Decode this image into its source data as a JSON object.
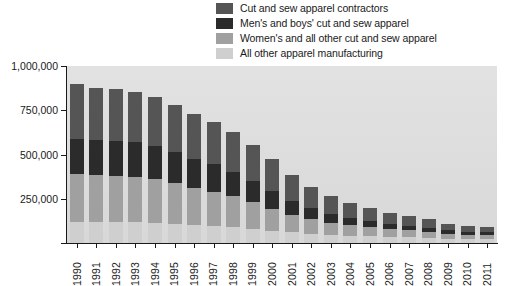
{
  "chart_data": {
    "type": "bar",
    "subtype": "stacked-vertical",
    "title": "",
    "xlabel": "",
    "ylabel": "",
    "ylim": [
      0,
      1000000
    ],
    "ytick_values": [
      0,
      250000,
      500000,
      750000,
      1000000
    ],
    "ytick_labels": [
      "",
      "250,000",
      "500,000",
      "750,000",
      "1,000,000"
    ],
    "grid": false,
    "legend_position": "top-center",
    "categories": [
      "1990",
      "1991",
      "1992",
      "1993",
      "1994",
      "1995",
      "1996",
      "1997",
      "1998",
      "1999",
      "2000",
      "2001",
      "2002",
      "2003",
      "2004",
      "2005",
      "2006",
      "2007",
      "2008",
      "2009",
      "2010",
      "2011"
    ],
    "stack_order_bottom_to_top": [
      "All other apparel manufacturing",
      "Women's and all other cut and sew apparel",
      "Men's and boys' cut and sew apparel",
      "Cut and sew apparel contractors"
    ],
    "series": [
      {
        "name": "Cut and sew apparel contractors",
        "color": "#555555",
        "values": [
          310000,
          295000,
          290000,
          285000,
          275000,
          265000,
          250000,
          240000,
          225000,
          205000,
          180000,
          145000,
          120000,
          100000,
          85000,
          72000,
          62000,
          55000,
          48000,
          38000,
          34000,
          32000
        ]
      },
      {
        "name": "Men's and boys' cut and sew apparel",
        "color": "#2b2b2b",
        "values": [
          200000,
          200000,
          198000,
          195000,
          190000,
          178000,
          165000,
          155000,
          140000,
          120000,
          100000,
          78000,
          62000,
          50000,
          42000,
          36000,
          31000,
          27000,
          24000,
          19000,
          17000,
          16000
        ]
      },
      {
        "name": "Women's and all other cut and sew apparel",
        "color": "#a0a0a0",
        "values": [
          270000,
          265000,
          262000,
          258000,
          248000,
          230000,
          212000,
          195000,
          175000,
          150000,
          125000,
          100000,
          82000,
          68000,
          58000,
          50000,
          44000,
          39000,
          34000,
          27000,
          24000,
          23000
        ]
      },
      {
        "name": "All other apparel manufacturing",
        "color": "#cfcfcf",
        "values": [
          120000,
          118000,
          118000,
          116000,
          112000,
          107000,
          100000,
          95000,
          88000,
          80000,
          70000,
          60000,
          52000,
          46000,
          42000,
          38000,
          35000,
          32000,
          29000,
          25000,
          23000,
          22000
        ]
      }
    ],
    "totals": [
      900000,
      878000,
      868000,
      854000,
      825000,
      780000,
      727000,
      685000,
      628000,
      555000,
      475000,
      383000,
      316000,
      264000,
      227000,
      196000,
      172000,
      153000,
      135000,
      109000,
      98000,
      93000
    ]
  },
  "legend": {
    "items": [
      {
        "label": "Cut and sew apparel contractors",
        "color": "#555555"
      },
      {
        "label": "Men's and boys' cut and sew apparel",
        "color": "#2b2b2b"
      },
      {
        "label": "Women's and all other cut and sew apparel",
        "color": "#a0a0a0"
      },
      {
        "label": "All other apparel manufacturing",
        "color": "#cfcfcf"
      }
    ]
  },
  "colors": {
    "plot_background": "#dcdcdc",
    "axis": "#1a1a1a",
    "text": "#1a1a1a",
    "page_background": "#ffffff"
  }
}
